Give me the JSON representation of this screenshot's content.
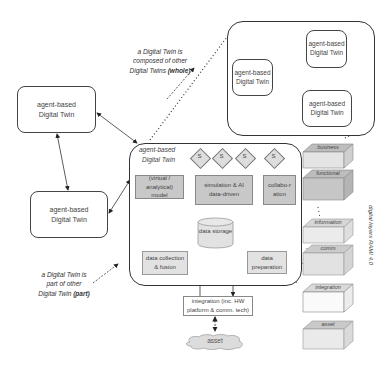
{
  "left_twins": [
    {
      "label": "agent-based Digital Twin"
    },
    {
      "label": "agent-based Digital Twin"
    }
  ],
  "notes": {
    "whole_line1": "a Digital Twin is",
    "whole_line2": "composed of other",
    "whole_line3a": "Digital Twins ",
    "whole_line3b": "(whole)",
    "part_line1": "a Digital Twin is",
    "part_line2": "part of other",
    "part_line3a": "Digital Twin ",
    "part_line3b": "(part)"
  },
  "composite": {
    "twins": [
      {
        "label": "agent-based Digital Twin"
      },
      {
        "label": "agent-based Digital Twin"
      },
      {
        "label": "agent-based Digital Twin"
      }
    ]
  },
  "main_twin": {
    "title_line1": "agent-based",
    "title_line2": "Digital Twin",
    "services": [
      "S",
      "S",
      "S",
      "S"
    ],
    "model": "(virtual / analytical) model",
    "simulation": "simulation & AI data-driven",
    "collaboration": "collabo-ration",
    "storage": "data storage",
    "collection": "data collection & fusion",
    "preparation": "data preparation"
  },
  "integration": "integration (inc. HW platform & comm. tech)",
  "asset": "asset",
  "rami_layers": {
    "title": "digital layers RAMI 4.0",
    "layers": [
      {
        "label": "business",
        "shade": "#bdbdbd"
      },
      {
        "label": "functional",
        "shade": "#bdbdbd"
      },
      {
        "label": "information",
        "shade": "#dcdcdc"
      },
      {
        "label": "comm",
        "shade": "#cfcfcf"
      },
      {
        "label": "integration",
        "shade": "#f2f2f2"
      },
      {
        "label": "asset",
        "shade": "#e2e2e2"
      }
    ]
  }
}
